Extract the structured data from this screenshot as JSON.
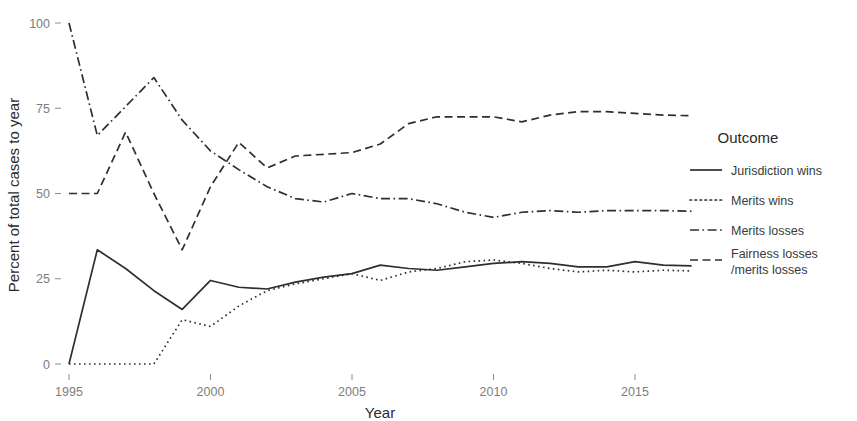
{
  "chart_data": {
    "type": "line",
    "title": "",
    "xlabel": "Year",
    "ylabel": "Percent of total cases to year",
    "xlim": [
      1995,
      2017
    ],
    "ylim": [
      0,
      100
    ],
    "grid": false,
    "legend_position": "right",
    "legend_title": "Outcome",
    "x_ticks": [
      1995,
      2000,
      2005,
      2010,
      2015
    ],
    "y_ticks": [
      0,
      25,
      50,
      75,
      100
    ],
    "x": [
      1995,
      1996,
      1997,
      1998,
      1999,
      2000,
      2001,
      2002,
      2003,
      2004,
      2005,
      2006,
      2007,
      2008,
      2009,
      2010,
      2011,
      2012,
      2013,
      2014,
      2015,
      2016,
      2017
    ],
    "series": [
      {
        "name": "Jurisdiction wins",
        "style": "solid",
        "values": [
          0,
          33.5,
          28.0,
          21.5,
          16.0,
          24.5,
          22.5,
          22.0,
          24.0,
          25.5,
          26.5,
          29.0,
          28.0,
          27.5,
          28.5,
          29.5,
          30.0,
          29.5,
          28.5,
          28.5,
          30.0,
          29.0,
          28.8
        ]
      },
      {
        "name": "Merits wins",
        "style": "dotted",
        "values": [
          0,
          0,
          0,
          0,
          13.0,
          11.0,
          17.0,
          21.5,
          23.5,
          25.0,
          26.5,
          24.5,
          27.0,
          28.0,
          30.0,
          30.5,
          29.5,
          28.0,
          27.0,
          27.5,
          27.0,
          27.5,
          27.3
        ]
      },
      {
        "name": "Merits losses",
        "style": "dashdot",
        "values": [
          100,
          67.0,
          75.5,
          84.0,
          71.5,
          62.5,
          57.0,
          52.0,
          48.5,
          47.5,
          50.0,
          48.5,
          48.5,
          47.0,
          44.5,
          43.0,
          44.5,
          45.0,
          44.5,
          45.0,
          45.0,
          45.0,
          44.8
        ]
      },
      {
        "name": "Fairness losses\n/merits losses",
        "style": "dashed",
        "values": [
          50,
          50.0,
          68.0,
          50.0,
          33.5,
          52.0,
          65.0,
          57.5,
          61.0,
          61.5,
          62.0,
          64.5,
          70.5,
          72.5,
          72.5,
          72.5,
          71.0,
          73.0,
          74.0,
          74.0,
          73.5,
          73.0,
          72.8
        ]
      }
    ]
  },
  "legend": {
    "title": "Outcome",
    "entries": [
      {
        "label": "Jurisdiction wins",
        "style": "solid"
      },
      {
        "label": "Merits wins",
        "style": "dotted"
      },
      {
        "label": "Merits losses",
        "style": "dashdot"
      },
      {
        "label_line1": "Fairness losses",
        "label_line2": "/merits losses",
        "style": "dashed"
      }
    ]
  },
  "axes": {
    "y_title": "Percent of total cases to year",
    "x_title": "Year",
    "y_tick_labels": [
      "0",
      "25",
      "50",
      "75",
      "100"
    ],
    "x_tick_labels": [
      "1995",
      "2000",
      "2005",
      "2010",
      "2015"
    ]
  },
  "colors": {
    "line": "#2f2f2f",
    "tick_text": "#7d7d7d",
    "axis_title": "#2b2b2b",
    "background": "#ffffff"
  }
}
